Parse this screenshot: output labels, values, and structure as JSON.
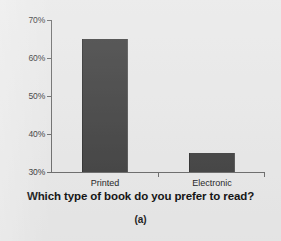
{
  "chart_data": {
    "type": "bar",
    "title": "Which type of book do you prefer to read?",
    "caption": "(a)",
    "xlabel": "",
    "ylabel": "",
    "categories": [
      "Printed",
      "Electronic"
    ],
    "values": [
      65,
      35
    ],
    "ylim": [
      30,
      70
    ],
    "yticks": [
      30,
      40,
      50,
      60,
      70
    ],
    "ytick_labels": [
      "30%",
      "40%",
      "50%",
      "60%",
      "70%"
    ],
    "grid": false,
    "legend": false,
    "bar_color": "#404040",
    "background_color": "#e9e9e9",
    "axis_color": "#6b6b6b",
    "text_color": "#101010"
  }
}
